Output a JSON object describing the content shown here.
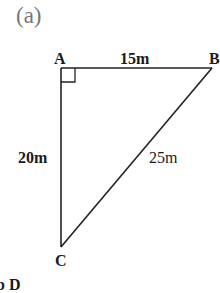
{
  "figure": {
    "part_label": "(a)",
    "vertices": {
      "A": {
        "label": "A",
        "x": 61,
        "y": 68
      },
      "B": {
        "label": "B",
        "x": 212,
        "y": 68
      },
      "C": {
        "label": "C",
        "x": 61,
        "y": 247
      }
    },
    "sides": {
      "AB": {
        "label": "15m"
      },
      "AC": {
        "label": "20m"
      },
      "BC": {
        "label": "25m"
      }
    },
    "right_angle_at": "A",
    "line_color": "#222222",
    "cut_off_text": "b  D"
  }
}
